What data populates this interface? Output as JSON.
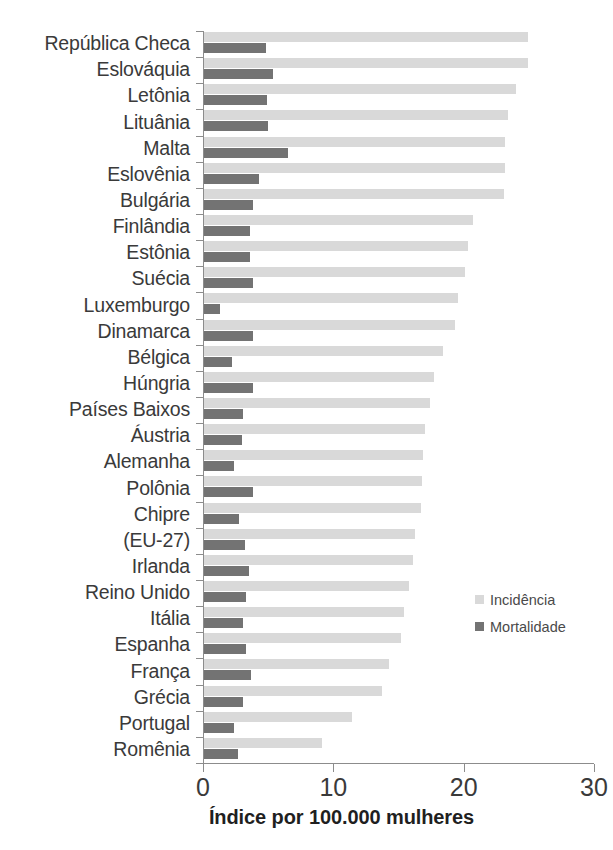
{
  "chart_data": {
    "type": "bar",
    "orientation": "horizontal",
    "grouped": true,
    "title": "",
    "subtitle": "",
    "xlabel": "Índice por 100.000 mulheres",
    "ylabel": "",
    "xlim": [
      0,
      30
    ],
    "xticks": [
      0,
      10,
      20,
      30
    ],
    "xtick_labels": [
      "0",
      "10",
      "20",
      "30"
    ],
    "grid": false,
    "legend_position": "middle-right",
    "colors": {
      "incidencia": "#d9d9d9",
      "mortalidade": "#737373",
      "axis": "#8c8c8c",
      "text": "#3a3a3a"
    },
    "legend": [
      {
        "label": "Incidência",
        "color": "#d9d9d9"
      },
      {
        "label": "Mortalidade",
        "color": "#737373"
      }
    ],
    "categories": [
      "República Checa",
      "Eslováquia",
      "Letônia",
      "Lituânia",
      "Malta",
      "Eslovênia",
      "Bulgária",
      "Finlândia",
      "Estônia",
      "Suécia",
      "Luxemburgo",
      "Dinamarca",
      "Bélgica",
      "Húngria",
      "Países Baixos",
      "Áustria",
      "Alemanha",
      "Polônia",
      "Chipre",
      "(EU-27)",
      "Irlanda",
      "Reino Unido",
      "Itália",
      "Espanha",
      "França",
      "Grécia",
      "Portugal",
      "Romênia"
    ],
    "series": [
      {
        "name": "Incidência",
        "values": [
          24.9,
          24.9,
          24.0,
          23.4,
          23.2,
          23.2,
          23.1,
          20.7,
          20.3,
          20.1,
          19.6,
          19.3,
          18.4,
          17.7,
          17.4,
          17.0,
          16.9,
          16.8,
          16.7,
          16.3,
          16.1,
          15.8,
          15.4,
          15.2,
          14.3,
          13.7,
          11.4,
          9.1
        ]
      },
      {
        "name": "Mortalidade",
        "values": [
          4.8,
          5.4,
          4.9,
          5.0,
          6.5,
          4.3,
          3.8,
          3.6,
          3.6,
          3.8,
          1.3,
          3.8,
          2.2,
          3.8,
          3.1,
          3.0,
          2.4,
          3.8,
          2.8,
          3.2,
          3.5,
          3.3,
          3.1,
          3.3,
          3.7,
          3.1,
          2.4,
          2.7
        ]
      }
    ]
  }
}
